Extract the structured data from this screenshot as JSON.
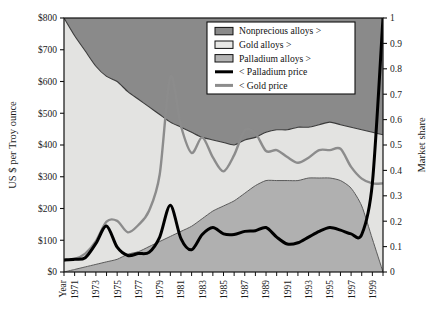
{
  "chart_data": {
    "type": "area",
    "title": "",
    "subtitle": "",
    "xlabel": "Year",
    "ylabel": "US $ per Troy ounce",
    "y2label": "Market share",
    "grid": false,
    "legend_position": "top-right",
    "xlim": [
      1970,
      2000
    ],
    "ylim": [
      0,
      800
    ],
    "y2lim": [
      0,
      1
    ],
    "x_tick_labels": [
      "1971",
      "1973",
      "1975",
      "1977",
      "1979",
      "1981",
      "1983",
      "1985",
      "1987",
      "1989",
      "1991",
      "1993",
      "1995",
      "1997",
      "1999"
    ],
    "x_tick_years": [
      1971,
      1973,
      1975,
      1977,
      1979,
      1981,
      1983,
      1985,
      1987,
      1989,
      1991,
      1993,
      1995,
      1997,
      1999
    ],
    "y_tick_labels": [
      "$0",
      "$100",
      "$200",
      "$300",
      "$400",
      "$500",
      "$600",
      "$700",
      "$800"
    ],
    "y_tick_values": [
      0,
      100,
      200,
      300,
      400,
      500,
      600,
      700,
      800
    ],
    "y2_tick_labels": [
      "0",
      "0.1",
      "0.2",
      "0.3",
      "0.4",
      "0.5",
      "0.6",
      "0.7",
      "0.8",
      "0.9",
      "1"
    ],
    "y2_tick_values": [
      0,
      0.1,
      0.2,
      0.3,
      0.4,
      0.5,
      0.6,
      0.7,
      0.8,
      0.9,
      1.0
    ],
    "x": [
      1970,
      1971,
      1972,
      1973,
      1974,
      1975,
      1976,
      1977,
      1978,
      1979,
      1980,
      1981,
      1982,
      1983,
      1984,
      1985,
      1986,
      1987,
      1988,
      1989,
      1990,
      1991,
      1992,
      1993,
      1994,
      1995,
      1996,
      1997,
      1998,
      1999,
      2000
    ],
    "series": [
      {
        "name": "Nonprecious alloys >",
        "kind": "area_share",
        "axis": "y2",
        "color": "#8a8a8a",
        "note": "top band; values are cumulative market share of the upper boundary of gold+palladium alloys",
        "values": [
          1.0,
          1.0,
          1.0,
          1.0,
          1.0,
          1.0,
          1.0,
          1.0,
          1.0,
          1.0,
          1.0,
          1.0,
          1.0,
          1.0,
          1.0,
          1.0,
          1.0,
          1.0,
          1.0,
          1.0,
          1.0,
          1.0,
          1.0,
          1.0,
          1.0,
          1.0,
          1.0,
          1.0,
          1.0,
          1.0,
          1.0
        ]
      },
      {
        "name": "Gold alloys >",
        "kind": "area_share",
        "axis": "y2",
        "color": "#e3e3e1",
        "note": "boundary between gold alloys and nonprecious alloys (top of gold band)",
        "values": [
          1.0,
          0.93,
          0.87,
          0.81,
          0.77,
          0.75,
          0.71,
          0.68,
          0.65,
          0.62,
          0.59,
          0.57,
          0.55,
          0.53,
          0.52,
          0.51,
          0.5,
          0.52,
          0.53,
          0.55,
          0.56,
          0.56,
          0.57,
          0.57,
          0.58,
          0.59,
          0.58,
          0.57,
          0.56,
          0.55,
          0.54
        ]
      },
      {
        "name": "Palladium alloys >",
        "kind": "area_share",
        "axis": "y2",
        "color": "#b0b0b0",
        "note": "top of palladium alloys band (lowest band, from 0)",
        "values": [
          0.0,
          0.01,
          0.02,
          0.03,
          0.04,
          0.05,
          0.07,
          0.08,
          0.1,
          0.12,
          0.14,
          0.16,
          0.18,
          0.21,
          0.24,
          0.26,
          0.28,
          0.31,
          0.34,
          0.36,
          0.36,
          0.36,
          0.36,
          0.37,
          0.37,
          0.37,
          0.36,
          0.33,
          0.26,
          0.13,
          0.0
        ]
      },
      {
        "name": "< Palladium price",
        "kind": "line",
        "axis": "y",
        "color": "#000000",
        "width": 3.0,
        "values": [
          38,
          40,
          45,
          90,
          145,
          78,
          52,
          58,
          62,
          110,
          210,
          105,
          70,
          118,
          140,
          120,
          118,
          128,
          130,
          140,
          110,
          88,
          92,
          110,
          128,
          140,
          132,
          120,
          118,
          280,
          800
        ]
      },
      {
        "name": "< Gold price",
        "kind": "line",
        "axis": "y",
        "color": "#8c8c8c",
        "width": 2.4,
        "values": [
          36,
          41,
          58,
          97,
          159,
          161,
          125,
          148,
          193,
          307,
          615,
          460,
          375,
          424,
          361,
          317,
          368,
          446,
          437,
          381,
          384,
          362,
          344,
          360,
          384,
          384,
          388,
          331,
          294,
          279,
          279
        ]
      }
    ],
    "annotations": []
  },
  "legend": {
    "items": [
      {
        "label": "Nonprecious alloys >",
        "swatch": "#8a8a8a",
        "type": "box"
      },
      {
        "label": "Gold alloys >",
        "swatch": "#e8e8e6",
        "type": "box"
      },
      {
        "label": "Palladium alloys >",
        "swatch": "#b4b4b4",
        "type": "box"
      },
      {
        "label": "< Palladium price",
        "swatch": "#000000",
        "type": "line"
      },
      {
        "label": "< Gold price",
        "swatch": "#8c8c8c",
        "type": "line"
      }
    ]
  }
}
